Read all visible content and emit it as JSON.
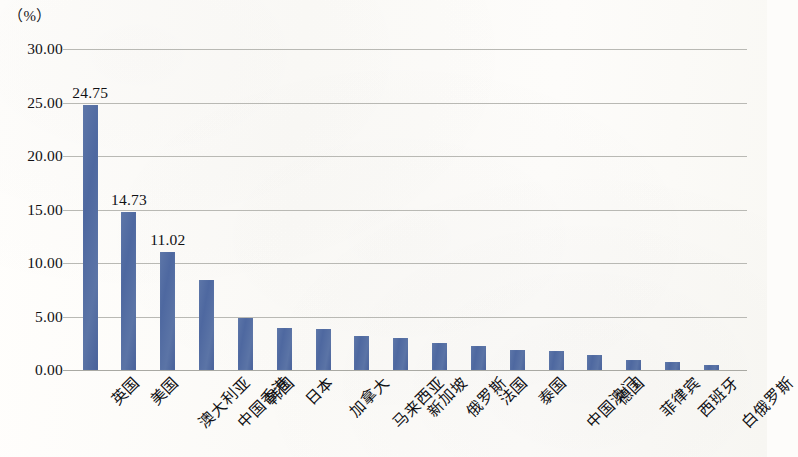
{
  "axis_unit": "（%）",
  "chart_data": {
    "type": "bar",
    "title": "",
    "subtitle": "",
    "xlabel": "",
    "ylabel": "（%）",
    "ylim": [
      0,
      30
    ],
    "y_ticks": [
      "0.00",
      "5.00",
      "10.00",
      "15.00",
      "20.00",
      "25.00",
      "30.00"
    ],
    "y_tick_values": [
      0,
      5,
      10,
      15,
      20,
      25,
      30
    ],
    "grid": true,
    "legend": "none",
    "bar_color": "#51699f",
    "categories": [
      "英国",
      "美国",
      "澳大利亚",
      "中国香港",
      "韩国",
      "日本",
      "加拿大",
      "马来西亚",
      "新加坡",
      "俄罗斯",
      "法国",
      "泰国",
      "中国澳门",
      "德国",
      "菲律宾",
      "西班牙",
      "白俄罗斯"
    ],
    "values": [
      24.75,
      14.73,
      11.02,
      8.4,
      4.9,
      3.9,
      3.85,
      3.2,
      2.95,
      2.55,
      2.25,
      1.85,
      1.75,
      1.45,
      0.95,
      0.75,
      0.5
    ],
    "data_labels": [
      "24.75",
      "14.73",
      "11.02",
      "",
      "",
      "",
      "",
      "",
      "",
      "",
      "",
      "",
      "",
      "",
      "",
      "",
      ""
    ]
  }
}
